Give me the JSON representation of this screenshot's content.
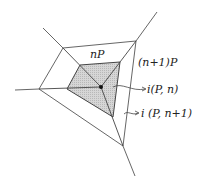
{
  "diagram": {
    "labels": {
      "inner_polytope": "nP",
      "outer_polytope": "(n+1)P",
      "interior_n": "i(P, n)",
      "interior_n1": "i (P, n+1)"
    },
    "colors": {
      "line": "#555555",
      "fill_inner": "#cfcfcf",
      "point": "#111111",
      "text": "#222222"
    }
  }
}
